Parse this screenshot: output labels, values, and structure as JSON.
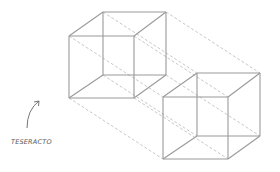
{
  "diagram": {
    "label": "TESERACTO",
    "colors": {
      "solid_edge": "#9a9a9a",
      "dashed_edge": "#b0b0b0",
      "label_text": "#555555",
      "arrow": "#666666"
    },
    "elements": {
      "cubes": [
        "cube-a",
        "cube-b"
      ],
      "connectors": 8,
      "annotation_arrow": "curved-arrow"
    }
  }
}
